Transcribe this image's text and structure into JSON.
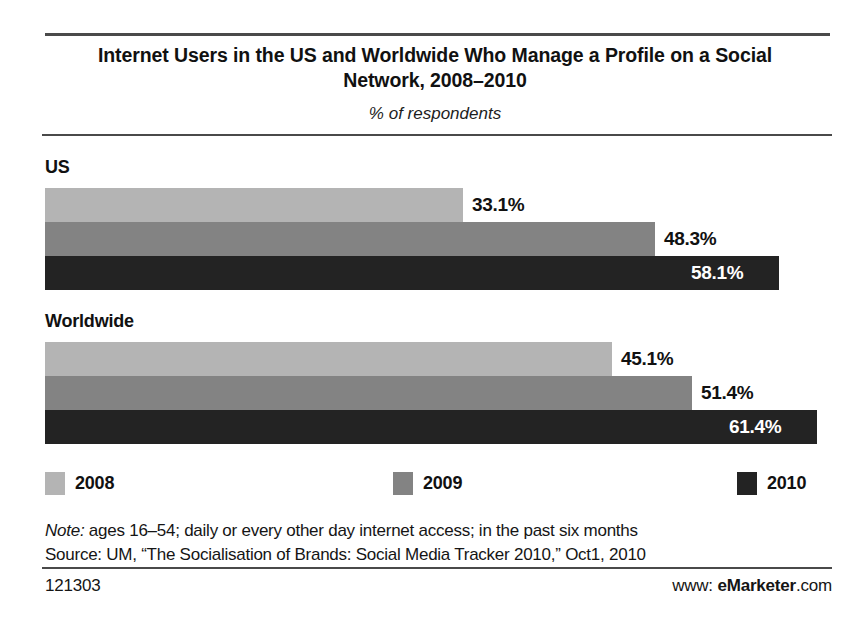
{
  "header": {
    "title": "Internet Users in the US and Worldwide Who Manage a Profile on a Social Network, 2008–2010",
    "subtitle": "% of respondents"
  },
  "chart_data": {
    "type": "bar",
    "orientation": "horizontal",
    "title": "Internet Users in the US and Worldwide Who Manage a Profile on a Social Network, 2008–2010",
    "subtitle": "% of respondents",
    "xlabel": "",
    "ylabel": "",
    "unit": "%",
    "grid": false,
    "axis_visible": false,
    "xlim": [
      0,
      65
    ],
    "legend_position": "bottom",
    "categories": [
      "US",
      "Worldwide"
    ],
    "series": [
      {
        "name": "2008",
        "color": "#b4b4b4",
        "values": [
          33.1,
          45.1
        ]
      },
      {
        "name": "2009",
        "color": "#838383",
        "values": [
          48.3,
          51.4
        ]
      },
      {
        "name": "2010",
        "color": "#232323",
        "values": [
          58.1,
          61.4
        ]
      }
    ],
    "groups": [
      {
        "label": "US",
        "bars": [
          {
            "series": "2008",
            "value": 33.1,
            "value_label": "33.1%",
            "color": "#b4b4b4",
            "label_placement": "outside",
            "label_color": "#111111"
          },
          {
            "series": "2009",
            "value": 48.3,
            "value_label": "48.3%",
            "color": "#838383",
            "label_placement": "outside",
            "label_color": "#111111"
          },
          {
            "series": "2010",
            "value": 58.1,
            "value_label": "58.1%",
            "color": "#232323",
            "label_placement": "inside",
            "label_color": "#ffffff"
          }
        ]
      },
      {
        "label": "Worldwide",
        "bars": [
          {
            "series": "2008",
            "value": 45.1,
            "value_label": "45.1%",
            "color": "#b4b4b4",
            "label_placement": "outside",
            "label_color": "#111111"
          },
          {
            "series": "2009",
            "value": 51.4,
            "value_label": "51.4%",
            "color": "#838383",
            "label_placement": "outside",
            "label_color": "#111111"
          },
          {
            "series": "2010",
            "value": 61.4,
            "value_label": "61.4%",
            "color": "#232323",
            "label_placement": "inside",
            "label_color": "#ffffff"
          }
        ]
      }
    ]
  },
  "legend": {
    "items": [
      {
        "label": "2008",
        "color": "#b4b4b4"
      },
      {
        "label": "2009",
        "color": "#838383"
      },
      {
        "label": "2010",
        "color": "#232323"
      }
    ]
  },
  "notes": {
    "note_lead": "Note:",
    "note_text": " ages 16–54; daily or every other day internet access; in the past six months",
    "source_text": "Source: UM, “The Socialisation of Brands: Social Media Tracker 2010,” Oct1, 2010"
  },
  "footer": {
    "chart_id": "121303",
    "brand_prefix": "www: ",
    "brand_name": "eMarketer",
    "brand_suffix": ".com"
  },
  "colors": {
    "series_2008": "#b4b4b4",
    "series_2009": "#838383",
    "series_2010": "#232323",
    "rule": "#4a4a4a",
    "text": "#151515",
    "background": "#ffffff"
  }
}
